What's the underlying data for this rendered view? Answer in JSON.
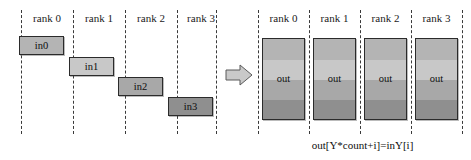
{
  "diagram": {
    "title_caption": "out[Y*count+i]=inY[i]",
    "left_panel": {
      "rank_labels": [
        "rank 0",
        "rank 1",
        "rank 2",
        "rank 3"
      ],
      "blocks": [
        {
          "label": "in0",
          "rank": 0,
          "fill": "#b4b4b4"
        },
        {
          "label": "in1",
          "rank": 1,
          "fill": "#c8c8c8"
        },
        {
          "label": "in2",
          "rank": 2,
          "fill": "#a8a8a8"
        },
        {
          "label": "in3",
          "rank": 3,
          "fill": "#8f8f8f"
        }
      ]
    },
    "arrow": {
      "name": "flow-arrow",
      "direction": "right",
      "fill": "#c9c9c9",
      "stroke": "#5a5a5a"
    },
    "right_panel": {
      "rank_labels": [
        "rank 0",
        "rank 1",
        "rank 2",
        "rank 3"
      ],
      "columns": [
        {
          "rank": 0,
          "label": "out",
          "bands": [
            {
              "source": "in0",
              "fill": "#b4b4b4"
            },
            {
              "source": "in1",
              "fill": "#c8c8c8"
            },
            {
              "source": "in2",
              "fill": "#a8a8a8"
            },
            {
              "source": "in3",
              "fill": "#8f8f8f"
            }
          ]
        },
        {
          "rank": 1,
          "label": "out",
          "bands": [
            {
              "source": "in0",
              "fill": "#b4b4b4"
            },
            {
              "source": "in1",
              "fill": "#c8c8c8"
            },
            {
              "source": "in2",
              "fill": "#a8a8a8"
            },
            {
              "source": "in3",
              "fill": "#8f8f8f"
            }
          ]
        },
        {
          "rank": 2,
          "label": "out",
          "bands": [
            {
              "source": "in0",
              "fill": "#b4b4b4"
            },
            {
              "source": "in1",
              "fill": "#c8c8c8"
            },
            {
              "source": "in2",
              "fill": "#a8a8a8"
            },
            {
              "source": "in3",
              "fill": "#8f8f8f"
            }
          ]
        },
        {
          "rank": 3,
          "label": "out",
          "bands": [
            {
              "source": "in0",
              "fill": "#b4b4b4"
            },
            {
              "source": "in1",
              "fill": "#c8c8c8"
            },
            {
              "source": "in2",
              "fill": "#a8a8a8"
            },
            {
              "source": "in3",
              "fill": "#8f8f8f"
            }
          ]
        }
      ]
    },
    "colors": {
      "divider": "#3a3a3a",
      "box_border": "#2b2b2b",
      "text": "#0d0d0d",
      "background": "#ffffff"
    }
  }
}
